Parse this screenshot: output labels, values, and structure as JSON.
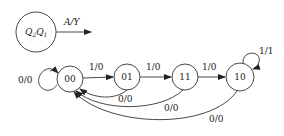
{
  "legend": {
    "state_label_main": "Q",
    "state_sub_1": "2",
    "state_label_main_2": "Q",
    "state_sub_2": "1",
    "transition_label": "A/Y"
  },
  "states": [
    {
      "id": "s00",
      "label": "00",
      "cx": 70,
      "cy": 79
    },
    {
      "id": "s01",
      "label": "01",
      "cx": 127,
      "cy": 77
    },
    {
      "id": "s11",
      "label": "11",
      "cx": 185,
      "cy": 77
    },
    {
      "id": "s10",
      "label": "10",
      "cx": 240,
      "cy": 77
    }
  ],
  "transitions": [
    {
      "from": "00",
      "to": "00",
      "label": "0/0"
    },
    {
      "from": "00",
      "to": "01",
      "label": "1/0"
    },
    {
      "from": "01",
      "to": "11",
      "label": "1/0"
    },
    {
      "from": "11",
      "to": "10",
      "label": "1/0"
    },
    {
      "from": "10",
      "to": "10",
      "label": "1/1"
    },
    {
      "from": "01",
      "to": "00",
      "label": "0/0"
    },
    {
      "from": "11",
      "to": "00",
      "label": "0/0"
    },
    {
      "from": "10",
      "to": "00",
      "label": "0/0"
    }
  ],
  "colors": {
    "stroke": "#333333",
    "text": "#222222",
    "background": "#ffffff"
  }
}
